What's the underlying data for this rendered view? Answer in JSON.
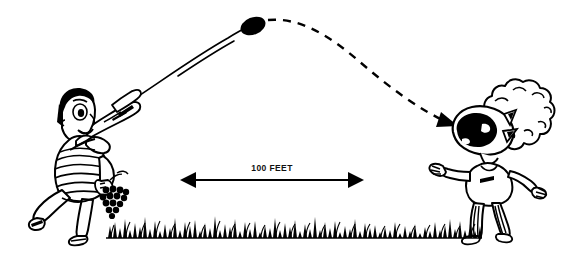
{
  "illustration": {
    "title": "Boy throwing a grape to a friend catching it in his mouth",
    "style": "hand-drawn black ink cartoon line art",
    "background_color": "#ffffff",
    "ink_color": "#000000",
    "canvas": {
      "width": 571,
      "height": 269
    }
  },
  "measurement": {
    "label": "100 FEET",
    "arrow_type": "double-headed horizontal arrow",
    "left_x": 182,
    "right_x": 362,
    "y": 180
  },
  "trajectory": {
    "ascending": {
      "style": "solid",
      "description": "solid arc rising from thrower's hand to apex"
    },
    "apex_projectile": {
      "name": "grape",
      "shape": "filled black oval",
      "x": 253,
      "y": 26
    },
    "descending": {
      "style": "dashed",
      "description": "dashed arc falling from apex to the catcher's open mouth",
      "arrowhead": "down-right arrowhead at catcher's mouth"
    }
  },
  "figures": {
    "thrower": {
      "name": "boy-throwing",
      "hair": "short dark hair",
      "shirt": "horizontally striped short-sleeve shirt",
      "pose": "running and pointing up-right with right arm",
      "holding": "bunch of grapes in left hand",
      "side": "left"
    },
    "catcher": {
      "name": "boy-catching",
      "hair": "large curly afro hair",
      "face": "wide open mouth filled black, triangular eyes",
      "shirt": "plain short-sleeve shirt",
      "pants": "striped pants",
      "pose": "arms spread, head tilted back, mouth open to catch",
      "side": "right"
    }
  },
  "ground": {
    "name": "grass-ground-line",
    "description": "horizontal ground line with dense grass tufts",
    "left_x": 105,
    "right_x": 482,
    "y": 237
  }
}
